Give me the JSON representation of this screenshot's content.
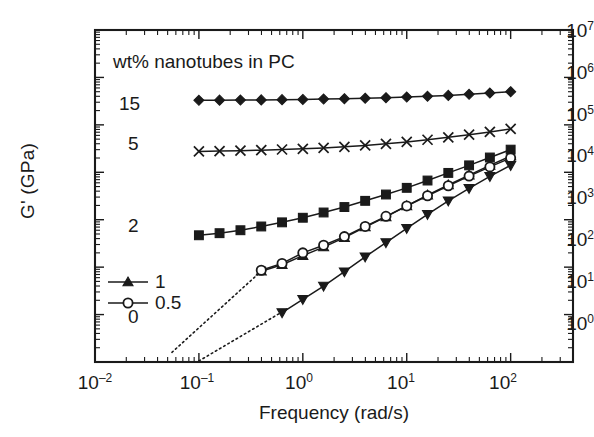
{
  "figure": {
    "title_annotation": "wt% nanotubes in PC",
    "xlabel": "Frequency (rad/s)",
    "ylabel": "G' (GPa)"
  },
  "axes": {
    "x_ticks": [
      {
        "mantissa": "10",
        "exp": "–2"
      },
      {
        "mantissa": "10",
        "exp": "–1"
      },
      {
        "mantissa": "10",
        "exp": "0"
      },
      {
        "mantissa": "10",
        "exp": "1"
      },
      {
        "mantissa": "10",
        "exp": "2"
      }
    ],
    "y_ticks": [
      {
        "mantissa": "10",
        "exp": "7"
      },
      {
        "mantissa": "10",
        "exp": "6"
      },
      {
        "mantissa": "10",
        "exp": "5"
      },
      {
        "mantissa": "10",
        "exp": "4"
      },
      {
        "mantissa": "10",
        "exp": "3"
      },
      {
        "mantissa": "10",
        "exp": "2"
      },
      {
        "mantissa": "10",
        "exp": "1"
      },
      {
        "mantissa": "10",
        "exp": "0"
      }
    ]
  },
  "series_labels": {
    "s15": "15",
    "s5": "5",
    "s2": "2",
    "s1": "1",
    "s05": "0.5",
    "s0": "0"
  },
  "chart_data": {
    "type": "line",
    "title": "wt% nanotubes in PC",
    "xlabel": "Frequency (rad/s)",
    "ylabel": "G' (GPa)",
    "xscale": "log",
    "yscale": "log",
    "xlim": [
      0.01,
      400
    ],
    "ylim": [
      1,
      10000000
    ],
    "grid": false,
    "legend_position": "inside-left",
    "annotations": [
      {
        "text": "wt% nanotubes in PC",
        "x": 0.02,
        "y": 2000000
      },
      {
        "text": "15",
        "x": 0.022,
        "y": 330000
      },
      {
        "text": "5",
        "x": 0.026,
        "y": 28000
      },
      {
        "text": "2",
        "x": 0.026,
        "y": 520
      },
      {
        "text": "0",
        "x": 0.026,
        "y": 9
      },
      {
        "text": "dotted reference lines have slope 2"
      }
    ],
    "series": [
      {
        "name": "15",
        "label": "15 wt% nanotubes in PC",
        "marker": "filled-diamond",
        "x": [
          0.1,
          0.158,
          0.251,
          0.398,
          0.631,
          1.0,
          1.585,
          2.512,
          3.981,
          6.31,
          10.0,
          15.85,
          25.12,
          39.81,
          63.1,
          100.0
        ],
        "y": [
          330000,
          332000,
          334000,
          336000,
          340000,
          344000,
          350000,
          356000,
          364000,
          373000,
          385000,
          400000,
          418000,
          440000,
          468000,
          500000
        ]
      },
      {
        "name": "5",
        "label": "5 wt% nanotubes in PC",
        "marker": "x-cross",
        "x": [
          0.1,
          0.158,
          0.251,
          0.398,
          0.631,
          1.0,
          1.585,
          2.512,
          3.981,
          6.31,
          10.0,
          15.85,
          25.12,
          39.81,
          63.1,
          100.0
        ],
        "y": [
          27500,
          28000,
          28600,
          29300,
          30200,
          31300,
          32700,
          34500,
          36800,
          39800,
          43600,
          48500,
          54500,
          62000,
          71000,
          82000
        ]
      },
      {
        "name": "2",
        "label": "2 wt% nanotubes in PC",
        "marker": "filled-square",
        "x": [
          0.1,
          0.158,
          0.251,
          0.398,
          0.631,
          1.0,
          1.585,
          2.512,
          3.981,
          6.31,
          10.0,
          15.85,
          25.12,
          39.81,
          63.1,
          100.0
        ],
        "y": [
          470,
          520,
          600,
          720,
          880,
          1100,
          1420,
          1850,
          2500,
          3400,
          4700,
          6700,
          9700,
          14000,
          20500,
          30000
        ]
      },
      {
        "name": "1",
        "label": "1 wt% nanotubes in PC",
        "marker": "filled-triangle-up",
        "x": [
          0.398,
          0.631,
          1.0,
          1.585,
          2.512,
          3.981,
          6.31,
          10.0,
          15.85,
          25.12,
          39.81,
          63.1,
          100.0
        ],
        "y": [
          82,
          112,
          175,
          265,
          420,
          700,
          1150,
          1950,
          3300,
          5400,
          8700,
          14000,
          22000
        ]
      },
      {
        "name": "0.5",
        "label": "0.5 wt% nanotubes in PC",
        "marker": "open-circle",
        "x": [
          0.398,
          0.631,
          1.0,
          1.585,
          2.512,
          3.981,
          6.31,
          10.0,
          15.85,
          25.12,
          39.81,
          63.1,
          100.0
        ],
        "y": [
          86,
          120,
          200,
          290,
          440,
          720,
          1180,
          1950,
          3200,
          5200,
          8300,
          13000,
          20000
        ]
      },
      {
        "name": "0",
        "label": "0 wt% nanotubes in PC (neat polycarbonate)",
        "marker": "filled-triangle-down",
        "x": [
          0.631,
          1.0,
          1.585,
          2.512,
          3.981,
          6.31,
          10.0,
          15.85,
          25.12,
          39.81,
          63.1,
          100.0
        ],
        "y": [
          11,
          21,
          40,
          80,
          165,
          330,
          660,
          1300,
          2500,
          4600,
          8200,
          14000
        ]
      }
    ],
    "reference_lines": [
      {
        "name": "slope-2-guide-upper",
        "style": "dotted",
        "slope": 2,
        "x": [
          0.055,
          0.45
        ],
        "y": [
          1.6,
          105
        ]
      },
      {
        "name": "slope-2-guide-lower",
        "style": "dotted",
        "slope": 2,
        "x": [
          0.1,
          0.7
        ],
        "y": [
          1.05,
          13
        ]
      }
    ]
  }
}
